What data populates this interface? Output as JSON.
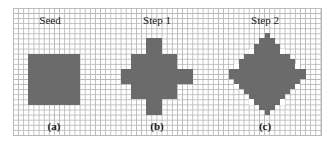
{
  "figure": {
    "grid": {
      "cols": 60,
      "rows": 25,
      "line_color": "#b8b8b8",
      "fill_color": "#6b6b6b"
    },
    "panels": [
      {
        "title": "Seed",
        "caption": "(a)",
        "title_x": 50,
        "title_y": 15,
        "caption_x": 54,
        "caption_y": 121,
        "shape": {
          "type": "rects",
          "rects": [
            {
              "c0": 3,
              "r0": 9,
              "c1": 12,
              "r1": 18
            }
          ]
        }
      },
      {
        "title": "Step 1",
        "caption": "(b)",
        "title_x": 157,
        "title_y": 15,
        "caption_x": 157,
        "caption_y": 121,
        "shape": {
          "type": "rects",
          "rects": [
            {
              "c0": 23,
              "r0": 9,
              "c1": 31,
              "r1": 17
            },
            {
              "c0": 26,
              "r0": 6,
              "c1": 28,
              "r1": 8
            },
            {
              "c0": 26,
              "r0": 18,
              "c1": 28,
              "r1": 20
            },
            {
              "c0": 21,
              "r0": 12,
              "c1": 22,
              "r1": 14
            },
            {
              "c0": 32,
              "r0": 12,
              "c1": 34,
              "r1": 14
            }
          ]
        }
      },
      {
        "title": "Step 2",
        "caption": "(c)",
        "title_x": 265,
        "title_y": 15,
        "caption_x": 265,
        "caption_y": 121,
        "shape": {
          "type": "diamond",
          "center_col": 49,
          "center_row": 12.5,
          "radius": 7.5,
          "notches": [
            {
              "c": 46,
              "r": 8
            },
            {
              "c": 52,
              "r": 8
            },
            {
              "c": 43,
              "r": 11
            },
            {
              "c": 55,
              "r": 11
            },
            {
              "c": 43,
              "r": 15
            },
            {
              "c": 55,
              "r": 15
            },
            {
              "c": 46,
              "r": 18
            },
            {
              "c": 52,
              "r": 18
            }
          ]
        }
      }
    ]
  }
}
